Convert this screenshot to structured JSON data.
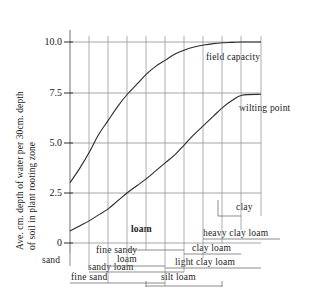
{
  "chart_data": {
    "type": "line",
    "title": "",
    "xlabel": "",
    "ylabel_line1": "Ave. cm. depth of water per 30cm. depth",
    "ylabel_line2": "of soil in plant rooting zone",
    "ylim": [
      0,
      11
    ],
    "yticks": [
      "0",
      "2.5",
      "5.0",
      "7.5",
      "10.0"
    ],
    "ytick_values": [
      0,
      2.5,
      5.0,
      7.5,
      10.0
    ],
    "grid": true,
    "legend_position": "inline-right",
    "xaxis_note": "soil texture classes from sand (left) to clay (right)",
    "series": [
      {
        "name": "field capacity",
        "label": "field capacity",
        "points": [
          {
            "x": 0.0,
            "y": 3.0
          },
          {
            "x": 0.5,
            "y": 3.7
          },
          {
            "x": 1.0,
            "y": 4.5
          },
          {
            "x": 1.5,
            "y": 5.4
          },
          {
            "x": 2.0,
            "y": 6.1
          },
          {
            "x": 2.5,
            "y": 6.8
          },
          {
            "x": 3.0,
            "y": 7.4
          },
          {
            "x": 3.5,
            "y": 7.9
          },
          {
            "x": 4.0,
            "y": 8.4
          },
          {
            "x": 4.5,
            "y": 8.8
          },
          {
            "x": 5.0,
            "y": 9.1
          },
          {
            "x": 5.5,
            "y": 9.4
          },
          {
            "x": 6.0,
            "y": 9.6
          },
          {
            "x": 6.5,
            "y": 9.75
          },
          {
            "x": 7.0,
            "y": 9.85
          },
          {
            "x": 7.5,
            "y": 9.92
          },
          {
            "x": 8.0,
            "y": 9.96
          },
          {
            "x": 8.5,
            "y": 9.98
          },
          {
            "x": 9.0,
            "y": 10.0
          },
          {
            "x": 10.0,
            "y": 10.0
          }
        ]
      },
      {
        "name": "wilting point",
        "label": "wilting point",
        "points": [
          {
            "x": 0.0,
            "y": 0.6
          },
          {
            "x": 0.5,
            "y": 0.85
          },
          {
            "x": 1.0,
            "y": 1.1
          },
          {
            "x": 1.5,
            "y": 1.4
          },
          {
            "x": 2.0,
            "y": 1.7
          },
          {
            "x": 2.5,
            "y": 2.1
          },
          {
            "x": 3.0,
            "y": 2.5
          },
          {
            "x": 3.5,
            "y": 2.85
          },
          {
            "x": 4.0,
            "y": 3.2
          },
          {
            "x": 4.5,
            "y": 3.6
          },
          {
            "x": 5.0,
            "y": 4.0
          },
          {
            "x": 5.5,
            "y": 4.4
          },
          {
            "x": 6.0,
            "y": 4.9
          },
          {
            "x": 6.5,
            "y": 5.4
          },
          {
            "x": 7.0,
            "y": 5.85
          },
          {
            "x": 7.5,
            "y": 6.3
          },
          {
            "x": 8.0,
            "y": 6.75
          },
          {
            "x": 8.5,
            "y": 7.1
          },
          {
            "x": 9.0,
            "y": 7.35
          },
          {
            "x": 10.0,
            "y": 7.4
          }
        ]
      }
    ],
    "soil_classes": [
      "sand",
      "fine sand",
      "sandy loam",
      "fine sandy loam",
      "loam",
      "silt loam",
      "light clay loam",
      "clay loam",
      "heavy clay loam",
      "clay"
    ]
  },
  "axis": {
    "ticks": [
      {
        "label": "10.0"
      },
      {
        "label": "7.5"
      },
      {
        "label": "5.0"
      },
      {
        "label": "2.5"
      },
      {
        "label": "0"
      }
    ]
  },
  "curve_labels": {
    "field_capacity": "field capacity",
    "wilting_point": "wilting point"
  },
  "categories": {
    "sand": "sand",
    "fine_sand": "fine sand",
    "sandy_loam": "sandy loam",
    "fine_sandy": "fine sandy",
    "fine_sandy_loam2": "loam",
    "loam": "loam",
    "silt_loam": "silt loam",
    "light_clay_loam": "light clay loam",
    "clay_loam": "clay loam",
    "heavy_clay_loam": "heavy clay loam",
    "clay": "clay"
  },
  "colors": {
    "background": "#ffffff",
    "ink": "#1a1a1a",
    "grid": "#8a8a8a",
    "curve": "#2b2b2b"
  }
}
